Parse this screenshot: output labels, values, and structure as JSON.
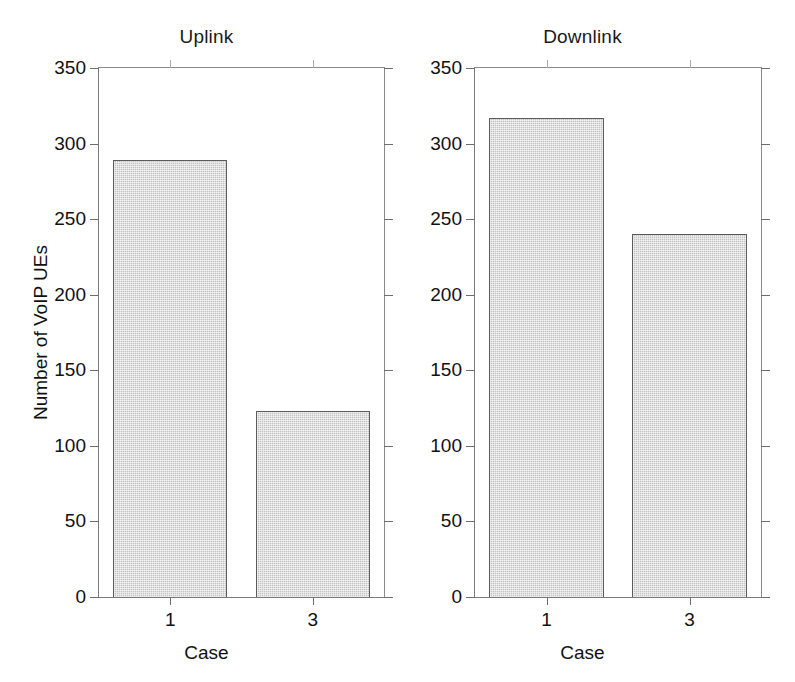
{
  "chart_data": {
    "type": "bar",
    "title": "",
    "panels": [
      {
        "title": "Uplink",
        "xlabel": "Case",
        "ylabel": "Number of VoIP UEs",
        "categories": [
          "1",
          "3"
        ],
        "values": [
          289,
          123
        ],
        "ylim": [
          0,
          350
        ],
        "yticks": [
          0,
          50,
          100,
          150,
          200,
          250,
          300,
          350
        ],
        "ytick_labels": [
          "0",
          "50",
          "100",
          "150",
          "200",
          "250",
          "300",
          "350"
        ],
        "grid": false
      },
      {
        "title": "Downlink",
        "xlabel": "Case",
        "ylabel": "",
        "categories": [
          "1",
          "3"
        ],
        "values": [
          317,
          240
        ],
        "ylim": [
          0,
          350
        ],
        "yticks": [
          0,
          50,
          100,
          150,
          200,
          250,
          300,
          350
        ],
        "ytick_labels": [
          "0",
          "50",
          "100",
          "150",
          "200",
          "250",
          "300",
          "350"
        ],
        "grid": false
      }
    ],
    "legend": [],
    "colors": {
      "bar_fill": "#c3c3c3",
      "bar_edge": "#5c5c5c",
      "axis": "#7a7a7a",
      "text": "#111111",
      "background": "#ffffff"
    }
  },
  "uplink": {
    "title": "Uplink",
    "xlabel": "Case",
    "ylabel": "Number of VoIP UEs",
    "ytick_labels": [
      "350",
      "300",
      "250",
      "200",
      "150",
      "100",
      "50",
      "0"
    ],
    "xtick_labels": [
      "1",
      "3"
    ]
  },
  "downlink": {
    "title": "Downlink",
    "xlabel": "Case",
    "ylabel": "",
    "ytick_labels": [
      "350",
      "300",
      "250",
      "200",
      "150",
      "100",
      "50",
      "0"
    ],
    "xtick_labels": [
      "1",
      "3"
    ]
  }
}
